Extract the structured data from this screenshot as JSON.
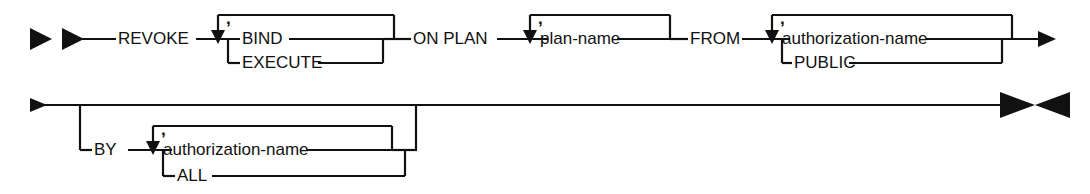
{
  "diagram": {
    "kind": "railroad-syntax-diagram",
    "statement": "REVOKE",
    "line_color": "#111111",
    "background_color": "#ffffff",
    "rows": [
      {
        "row_index": 1,
        "start_marker": "double-arrow-start",
        "end_marker": "arrow-continue"
      },
      {
        "row_index": 2,
        "start_marker": "arrow-continue",
        "end_marker": "double-arrow-end"
      }
    ]
  },
  "tokens": {
    "revoke": "REVOKE",
    "bind": "BIND",
    "execute": "EXECUTE",
    "on_plan": "ON PLAN",
    "plan_name": "plan-name",
    "from": "FROM",
    "authorization_name_1": "authorization-name",
    "public": "PUBLIC",
    "by": "BY",
    "authorization_name_2": "authorization-name",
    "all": "ALL",
    "comma_1": ",",
    "comma_2": ",",
    "comma_3": ",",
    "comma_4": ","
  },
  "markers": {
    "start_arrow_1": "start-arrow-icon",
    "start_arrow_2": "start-arrow-icon",
    "row1_end_arrow": "continuation-arrow-icon",
    "row2_start_arrow": "continuation-arrow-icon",
    "end_arrow_right": "terminator-arrow-icon",
    "end_arrow_left": "terminator-arrow-icon",
    "loop_arrow_bind": "loop-down-arrow-icon",
    "loop_arrow_plan_name": "loop-down-arrow-icon",
    "loop_arrow_auth_1": "loop-down-arrow-icon",
    "loop_arrow_auth_2": "loop-down-arrow-icon"
  }
}
